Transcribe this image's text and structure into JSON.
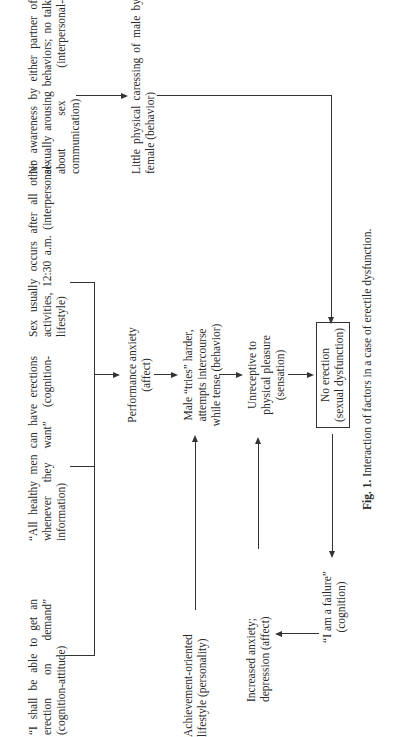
{
  "diagram": {
    "nodes": {
      "attitude": "“I shall be able to get an erection on demand” (cognition-attitude)",
      "information": "“All healthy men can have erections whenever they want” (cognition-information)",
      "lifestyle": "Sex usually occurs after all other activities, 12:30 a.m. (interpersonal-lifestyle)",
      "communication": "No awareness by either partner of sexually arousing behaviors; no talk about sex (interpersonal-communication)",
      "caressing": "Little physical caressing of male by female (behavior)",
      "performance_anxiety_1": "Performance anxiety",
      "performance_anxiety_2": "(affect)",
      "tries_1": "Male “tries” harder,",
      "tries_2": "attempts intercourse",
      "tries_3": "while tense (behavior)",
      "unreceptive_1": "Unreceptive to",
      "unreceptive_2": "physical pleasure",
      "unreceptive_3": "(sensation)",
      "no_erection_1": "No erection",
      "no_erection_2": "(sexual dysfunction)",
      "achievement": "Achievement-oriented lifestyle (personality)",
      "increased_anxiety": "Increased anxiety; depression (affect)",
      "failure_1": "“I am a failure”",
      "failure_2": "(cognition)"
    },
    "caption_label": "Fig. 1.",
    "caption_text": "Interaction of factors in a case of erectile dysfunction."
  }
}
